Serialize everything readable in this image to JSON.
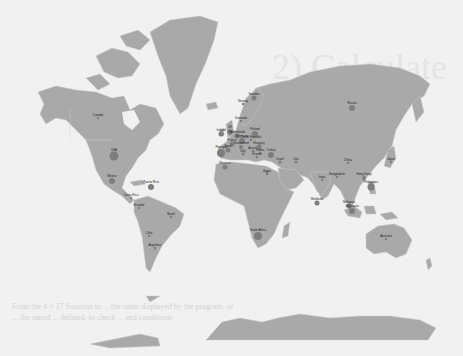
{
  "map": {
    "type": "bubble-map",
    "projection": "mercator",
    "colors": {
      "ocean": "#f1f1f1",
      "land": "#a9a9a9",
      "borders": "#c8c8c8",
      "bubble": "#7d7d7d",
      "label": "#222222"
    },
    "ghost_text": {
      "line1": "2) Calculate",
      "line2": "From the 4 × 17  Solution to ... the same displayed by the program, of",
      "line3": "... the stated ... defined, to check ... and conditions"
    },
    "markers": [
      {
        "label": "Canada",
        "x": 98,
        "y": 118,
        "r": 1.2
      },
      {
        "label": "USA",
        "x": 114,
        "y": 156,
        "r": 4.5
      },
      {
        "label": "Mexico",
        "x": 112,
        "y": 181,
        "r": 3
      },
      {
        "label": "Costa Rica",
        "x": 131,
        "y": 198,
        "r": 1.2
      },
      {
        "label": "Puerto Rico",
        "x": 151,
        "y": 187,
        "r": 3
      },
      {
        "label": "Ecuador",
        "x": 139,
        "y": 208,
        "r": 1.2
      },
      {
        "label": "Brazil",
        "x": 171,
        "y": 217,
        "r": 1.2
      },
      {
        "label": "Chile",
        "x": 149,
        "y": 236,
        "r": 1.2
      },
      {
        "label": "Argentina",
        "x": 155,
        "y": 248,
        "r": 1.2
      },
      {
        "label": "Norway",
        "x": 243,
        "y": 104,
        "r": 1.2
      },
      {
        "label": "Sweden",
        "x": 254,
        "y": 98,
        "r": 2.5
      },
      {
        "label": "Denmark",
        "x": 241,
        "y": 121,
        "r": 1.2
      },
      {
        "label": "Ireland",
        "x": 221,
        "y": 134,
        "r": 2.5
      },
      {
        "label": "UK",
        "x": 230,
        "y": 132,
        "r": 2.8
      },
      {
        "label": "Netherlands",
        "x": 237,
        "y": 136,
        "r": 2.5
      },
      {
        "label": "Germany",
        "x": 242,
        "y": 141,
        "r": 3
      },
      {
        "label": "Poland",
        "x": 255,
        "y": 134,
        "r": 3
      },
      {
        "label": "Czech Republic",
        "x": 251,
        "y": 140,
        "r": 1.2
      },
      {
        "label": "Switzerland",
        "x": 241,
        "y": 147,
        "r": 2
      },
      {
        "label": "France",
        "x": 232,
        "y": 144,
        "r": 2.5
      },
      {
        "label": "Portugal",
        "x": 221,
        "y": 153,
        "r": 4
      },
      {
        "label": "Spain",
        "x": 228,
        "y": 150,
        "r": 2.5
      },
      {
        "label": "Italy",
        "x": 243,
        "y": 154,
        "r": 1.5
      },
      {
        "label": "Austria",
        "x": 253,
        "y": 151,
        "r": 1.5
      },
      {
        "label": "Hungary",
        "x": 259,
        "y": 147,
        "r": 2.5
      },
      {
        "label": "Serbia",
        "x": 260,
        "y": 153,
        "r": 1.5
      },
      {
        "label": "Greece",
        "x": 257,
        "y": 157,
        "r": 1.2
      },
      {
        "label": "Turkey",
        "x": 271,
        "y": 155,
        "r": 3
      },
      {
        "label": "Israel",
        "x": 280,
        "y": 162,
        "r": 1.5
      },
      {
        "label": "Iran",
        "x": 296,
        "y": 162,
        "r": 1.5
      },
      {
        "label": "Morocco",
        "x": 225,
        "y": 167,
        "r": 2.5
      },
      {
        "label": "Egypt",
        "x": 267,
        "y": 174,
        "r": 1.2
      },
      {
        "label": "Russia",
        "x": 352,
        "y": 108,
        "r": 3
      },
      {
        "label": "China",
        "x": 348,
        "y": 163,
        "r": 1.2
      },
      {
        "label": "Japan",
        "x": 391,
        "y": 162,
        "r": 1.2
      },
      {
        "label": "India",
        "x": 322,
        "y": 180,
        "r": 1.2
      },
      {
        "label": "Bangladesh",
        "x": 337,
        "y": 177,
        "r": 1.2
      },
      {
        "label": "Hong Kong",
        "x": 364,
        "y": 178,
        "r": 2
      },
      {
        "label": "Philippines",
        "x": 371,
        "y": 187,
        "r": 3.5
      },
      {
        "label": "Maldives",
        "x": 317,
        "y": 203,
        "r": 2.5
      },
      {
        "label": "Malaysia",
        "x": 349,
        "y": 206,
        "r": 2.5
      },
      {
        "label": "Singapore",
        "x": 352,
        "y": 211,
        "r": 3
      },
      {
        "label": "South Africa",
        "x": 258,
        "y": 236,
        "r": 4
      },
      {
        "label": "Australia",
        "x": 386,
        "y": 239,
        "r": 1.2
      }
    ]
  }
}
